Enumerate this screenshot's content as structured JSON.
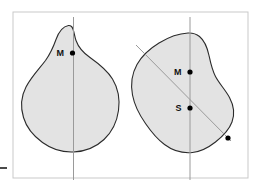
{
  "figure": {
    "title": "",
    "background_color": "#ffffff",
    "frame": {
      "name": "figure-frame",
      "color": "#c9c9c9",
      "x": 13,
      "y": 12,
      "width": 235,
      "height": 166
    },
    "edge_tick": {
      "name": "left-edge-tick",
      "color": "#4a4a4a",
      "x": 0,
      "y": 167,
      "width": 7,
      "height": 2
    },
    "shape_style": {
      "fill": "#e3e3e3",
      "stroke": "#2b2b2b",
      "stroke_width": 1.1
    },
    "axis_style": {
      "stroke": "#9a9a9a",
      "stroke_width": 1
    },
    "marker_style": {
      "fill": "#000000",
      "radius": 2.6
    },
    "shapes": [
      {
        "name": "left-blob",
        "path": "M 68.5 25.5 C 62.5 26.5 58.5 32.5 56.0 39.5 C 53.5 46.5 50.5 53.5 45.5 60.5 C 39.5 68.5 31.5 76.5 26.0 87.0 C 21.0 96.5 20.5 107.5 23.5 117.5 C 26.5 127.5 33.5 136.0 42.5 142.5 C 51.5 149.0 62.5 152.5 73.5 152.0 C 85.0 151.5 96.0 147.0 104.0 139.5 C 112.0 132.0 117.0 121.5 118.5 110.5 C 120.0 99.5 118.0 88.0 112.5 79.0 C 107.0 70.0 98.5 63.5 90.0 57.5 C 83.5 53.0 78.5 47.5 76.0 40.5 C 74.0 34.5 74.0 29.0 71.5 26.5 C 70.5 25.6 69.6 25.4 68.5 25.5 Z",
        "vertical_axis": {
          "name": "left-vertical-axis",
          "x": 73.5,
          "y1": 17.0,
          "y2": 180.0
        },
        "markers": [
          {
            "name": "left-centroid-marker",
            "label": "M",
            "x": 72.5,
            "y": 53.0,
            "label_dx": -8.5,
            "label_dy": 3.0
          }
        ]
      },
      {
        "name": "right-blob",
        "path": "M 188.0 33.0 C 178.0 33.5 168.0 37.5 159.0 43.0 C 150.0 48.5 142.0 55.5 137.0 64.5 C 132.0 73.5 130.5 84.5 132.5 95.0 C 134.5 105.5 139.5 115.0 145.5 123.5 C 151.0 131.5 157.0 139.0 164.5 144.5 C 172.5 150.5 182.5 153.5 192.5 152.5 C 201.0 151.6 208.5 147.5 215.5 142.0 C 222.5 136.5 229.0 130.0 232.0 122.0 C 235.0 114.0 233.5 105.0 229.5 97.5 C 225.5 90.0 219.5 84.0 215.5 76.5 C 212.0 70.0 210.5 62.5 209.0 55.5 C 207.5 48.5 205.0 41.0 199.5 36.5 C 196.3 33.9 192.3 32.8 188.0 33.0 Z",
        "vertical_axis": {
          "name": "right-vertical-axis",
          "x": 190.0,
          "y1": 17.0,
          "y2": 180.0
        },
        "diagonal_axis": {
          "name": "right-diagonal-axis",
          "x1": 136.0,
          "y1": 45.0,
          "x2": 231.0,
          "y2": 141.0
        },
        "markers": [
          {
            "name": "right-centroid-marker",
            "label": "M",
            "x": 190.0,
            "y": 72.0,
            "label_dx": -8.5,
            "label_dy": 3.0
          },
          {
            "name": "right-s-marker",
            "label": "S",
            "x": 190.0,
            "y": 108.0,
            "label_dx": -8.5,
            "label_dy": 3.0
          },
          {
            "name": "right-end-marker",
            "label": "",
            "x": 228.0,
            "y": 138.0,
            "label_dx": 0,
            "label_dy": 0
          }
        ]
      }
    ]
  }
}
